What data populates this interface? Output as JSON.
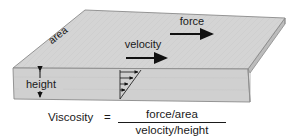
{
  "figure": {
    "title_labels": {
      "area": "area",
      "velocity": "velocity",
      "force": "force",
      "height": "height"
    },
    "formula": {
      "lhs": "Viscosity",
      "equals": "=",
      "numerator": "force/area",
      "denominator": "velocity/height"
    },
    "colors": {
      "top_face": "#d2d2d2",
      "front_face": "#cfcfcf",
      "right_face": "#bdbdbd",
      "edge": "#8a8a8a",
      "ink": "#1a1a1a",
      "background": "#ffffff"
    }
  }
}
